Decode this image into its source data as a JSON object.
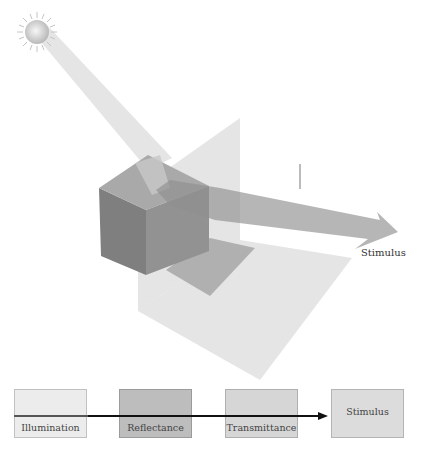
{
  "diagram": {
    "scene": {
      "light_source": "sun-icon",
      "beams": [
        "illumination-beam",
        "stimulus-beam"
      ],
      "objects": [
        "cube",
        "transparent-plane",
        "floor-plane",
        "shadow"
      ],
      "stimulus_label": "Stimulus"
    },
    "flow": {
      "stages": [
        {
          "label": "Illumination",
          "color": "#ececec"
        },
        {
          "label": "Reflectance",
          "color": "#bdbdbd"
        },
        {
          "label": "Transmittance",
          "color": "#d6d6d6"
        },
        {
          "label": "Stimulus",
          "color": "#dcdcdc"
        }
      ],
      "arrow_color": "#111111"
    }
  }
}
